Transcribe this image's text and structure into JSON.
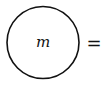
{
  "diagram": {
    "node": {
      "label": "m",
      "shape": "circle",
      "stroke": "#111111"
    },
    "operator": "="
  }
}
